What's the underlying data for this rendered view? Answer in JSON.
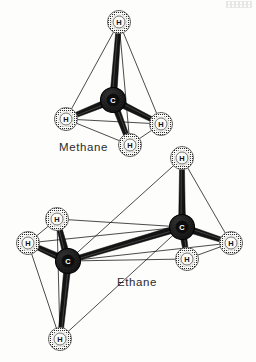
{
  "figure": {
    "background_color": "#fdfdfc",
    "ink_color": "#1a1a1a",
    "carbon_color": "#1c1c1c",
    "hydrogen_color": "#e8e8e4"
  },
  "labels": {
    "methane": "Methane",
    "ethane": "Ethane"
  },
  "atom_symbols": {
    "carbon": "C",
    "hydrogen": "H"
  },
  "molecules": [
    {
      "name": "Methane",
      "formula_atoms": {
        "carbon": 1,
        "hydrogen": 4
      },
      "atoms": [
        {
          "id": "m-c",
          "element": "C",
          "label": "C",
          "x": 113,
          "y": 100,
          "r": 12.5,
          "kind": "carbon"
        },
        {
          "id": "m-h1",
          "element": "H",
          "label": "H",
          "x": 119,
          "y": 22,
          "r": 11.5,
          "kind": "hydrogen"
        },
        {
          "id": "m-h2",
          "element": "H",
          "label": "H",
          "x": 66,
          "y": 119,
          "r": 11.5,
          "kind": "hydrogen"
        },
        {
          "id": "m-h3",
          "element": "H",
          "label": "H",
          "x": 161,
          "y": 124,
          "r": 11.5,
          "kind": "hydrogen"
        },
        {
          "id": "m-h4",
          "element": "H",
          "label": "H",
          "x": 130,
          "y": 145,
          "r": 11.5,
          "kind": "hydrogen"
        }
      ],
      "bonds": [
        {
          "from": "m-c",
          "to": "m-h1",
          "style": "rod"
        },
        {
          "from": "m-c",
          "to": "m-h2",
          "style": "rod"
        },
        {
          "from": "m-c",
          "to": "m-h3",
          "style": "rod"
        },
        {
          "from": "m-c",
          "to": "m-h4",
          "style": "rod"
        }
      ],
      "tetrahedron_edges": [
        {
          "from": "m-h1",
          "to": "m-h2"
        },
        {
          "from": "m-h1",
          "to": "m-h3"
        },
        {
          "from": "m-h1",
          "to": "m-h4"
        },
        {
          "from": "m-h2",
          "to": "m-h3"
        },
        {
          "from": "m-h2",
          "to": "m-h4"
        },
        {
          "from": "m-h3",
          "to": "m-h4"
        }
      ]
    },
    {
      "name": "Ethane",
      "formula_atoms": {
        "carbon": 2,
        "hydrogen": 6
      },
      "atoms": [
        {
          "id": "e-c1",
          "element": "C",
          "label": "C",
          "x": 182,
          "y": 227,
          "r": 12.5,
          "kind": "carbon"
        },
        {
          "id": "e-c2",
          "element": "C",
          "label": "C",
          "x": 68,
          "y": 261,
          "r": 12.5,
          "kind": "carbon"
        },
        {
          "id": "e-h1",
          "element": "H",
          "label": "H",
          "x": 182,
          "y": 158,
          "r": 11.5,
          "kind": "hydrogen"
        },
        {
          "id": "e-h2",
          "element": "H",
          "label": "H",
          "x": 231,
          "y": 243,
          "r": 11.5,
          "kind": "hydrogen"
        },
        {
          "id": "e-h3",
          "element": "H",
          "label": "H",
          "x": 187,
          "y": 259,
          "r": 11.5,
          "kind": "hydrogen"
        },
        {
          "id": "e-h4",
          "element": "H",
          "label": "H",
          "x": 57,
          "y": 219,
          "r": 11.5,
          "kind": "hydrogen"
        },
        {
          "id": "e-h5",
          "element": "H",
          "label": "H",
          "x": 28,
          "y": 243,
          "r": 11.5,
          "kind": "hydrogen"
        },
        {
          "id": "e-h6",
          "element": "H",
          "label": "H",
          "x": 60,
          "y": 339,
          "r": 11.5,
          "kind": "hydrogen"
        }
      ],
      "bonds": [
        {
          "from": "e-c1",
          "to": "e-c2",
          "style": "rod"
        },
        {
          "from": "e-c1",
          "to": "e-h1",
          "style": "rod"
        },
        {
          "from": "e-c1",
          "to": "e-h2",
          "style": "rod"
        },
        {
          "from": "e-c1",
          "to": "e-h3",
          "style": "rod"
        },
        {
          "from": "e-c2",
          "to": "e-h4",
          "style": "rod"
        },
        {
          "from": "e-c2",
          "to": "e-h5",
          "style": "rod"
        },
        {
          "from": "e-c2",
          "to": "e-h6",
          "style": "rod"
        }
      ],
      "tetrahedron_edges": [
        {
          "from": "e-h1",
          "to": "e-h2"
        },
        {
          "from": "e-h1",
          "to": "e-h3"
        },
        {
          "from": "e-h1",
          "to": "e-c2"
        },
        {
          "from": "e-h2",
          "to": "e-h3"
        },
        {
          "from": "e-h2",
          "to": "e-c2"
        },
        {
          "from": "e-h3",
          "to": "e-c2"
        },
        {
          "from": "e-h4",
          "to": "e-h5"
        },
        {
          "from": "e-h4",
          "to": "e-h6"
        },
        {
          "from": "e-h4",
          "to": "e-c1"
        },
        {
          "from": "e-h5",
          "to": "e-h6"
        },
        {
          "from": "e-h5",
          "to": "e-c1"
        },
        {
          "from": "e-h6",
          "to": "e-c1"
        }
      ]
    }
  ]
}
